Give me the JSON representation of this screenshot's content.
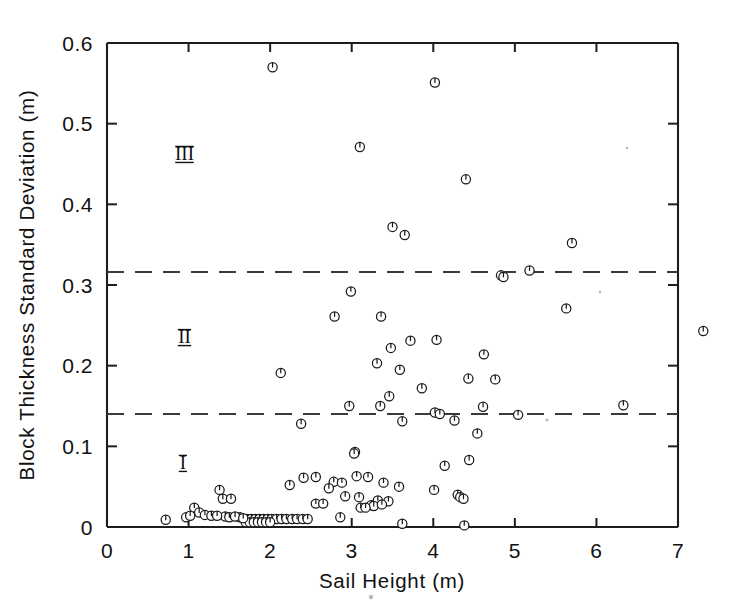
{
  "figure": {
    "background_color": "#ffffff",
    "ink_color": "#1a1a1a",
    "dash_color": "#3a3a3a"
  },
  "chart_data": {
    "type": "scatter",
    "title": "",
    "xlabel": "Sail Height (m)",
    "ylabel": "Block Thickness Standard Deviation (m)",
    "xlim": [
      0,
      7
    ],
    "ylim": [
      0,
      0.6
    ],
    "xticks": [
      0,
      1,
      2,
      3,
      4,
      5,
      6,
      7
    ],
    "xticklabels": [
      "0",
      "1",
      "2",
      "3",
      "4",
      "5",
      "6",
      "7"
    ],
    "yticks": [
      0,
      0.1,
      0.2,
      0.3,
      0.4,
      0.5,
      0.6
    ],
    "yticklabels": [
      "0",
      "0.1",
      "0.2",
      "0.3",
      "0.4",
      "0.5",
      "0.6"
    ],
    "grid": false,
    "legend": "none",
    "marker_style": "circle-with-vertical-tick",
    "annotations": [
      {
        "text": "III",
        "x": 0.95,
        "y": 0.455,
        "note": "zone-iii-label"
      },
      {
        "text": "II",
        "x": 0.95,
        "y": 0.228,
        "note": "zone-ii-label"
      },
      {
        "text": "I",
        "x": 0.93,
        "y": 0.072,
        "note": "zone-i-label"
      }
    ],
    "reference_lines": [
      {
        "orientation": "horizontal",
        "y": 0.316,
        "style": "dashed",
        "name": "zone-ii-iii-boundary"
      },
      {
        "orientation": "horizontal",
        "y": 0.14,
        "style": "dashed",
        "name": "zone-i-ii-boundary"
      }
    ],
    "points": [
      [
        2.03,
        0.57
      ],
      [
        4.02,
        0.551
      ],
      [
        3.1,
        0.471
      ],
      [
        4.4,
        0.431
      ],
      [
        5.7,
        0.352
      ],
      [
        3.5,
        0.372
      ],
      [
        3.65,
        0.362
      ],
      [
        2.99,
        0.292
      ],
      [
        4.83,
        0.312
      ],
      [
        4.86,
        0.31
      ],
      [
        5.18,
        0.318
      ],
      [
        2.79,
        0.261
      ],
      [
        3.36,
        0.261
      ],
      [
        5.63,
        0.271
      ],
      [
        7.31,
        0.243
      ],
      [
        3.48,
        0.222
      ],
      [
        4.62,
        0.214
      ],
      [
        4.04,
        0.232
      ],
      [
        3.72,
        0.231
      ],
      [
        3.31,
        0.203
      ],
      [
        3.59,
        0.195
      ],
      [
        2.13,
        0.191
      ],
      [
        4.76,
        0.183
      ],
      [
        4.43,
        0.184
      ],
      [
        3.86,
        0.172
      ],
      [
        3.46,
        0.162
      ],
      [
        2.97,
        0.15
      ],
      [
        3.35,
        0.15
      ],
      [
        4.02,
        0.142
      ],
      [
        4.61,
        0.149
      ],
      [
        4.08,
        0.14
      ],
      [
        5.04,
        0.139
      ],
      [
        6.33,
        0.151
      ],
      [
        2.38,
        0.128
      ],
      [
        3.62,
        0.131
      ],
      [
        4.26,
        0.132
      ],
      [
        4.54,
        0.116
      ],
      [
        3.04,
        0.093
      ],
      [
        3.03,
        0.091
      ],
      [
        4.44,
        0.083
      ],
      [
        4.14,
        0.076
      ],
      [
        2.41,
        0.061
      ],
      [
        2.56,
        0.062
      ],
      [
        3.06,
        0.063
      ],
      [
        3.2,
        0.062
      ],
      [
        2.78,
        0.056
      ],
      [
        2.88,
        0.055
      ],
      [
        3.39,
        0.055
      ],
      [
        2.24,
        0.052
      ],
      [
        3.58,
        0.05
      ],
      [
        2.72,
        0.048
      ],
      [
        4.01,
        0.046
      ],
      [
        1.38,
        0.046
      ],
      [
        1.42,
        0.035
      ],
      [
        1.52,
        0.035
      ],
      [
        2.92,
        0.038
      ],
      [
        3.09,
        0.037
      ],
      [
        3.32,
        0.033
      ],
      [
        3.45,
        0.032
      ],
      [
        4.3,
        0.04
      ],
      [
        4.33,
        0.037
      ],
      [
        4.37,
        0.035
      ],
      [
        2.56,
        0.029
      ],
      [
        2.65,
        0.029
      ],
      [
        3.24,
        0.027
      ],
      [
        3.27,
        0.026
      ],
      [
        3.37,
        0.028
      ],
      [
        3.11,
        0.024
      ],
      [
        3.17,
        0.024
      ],
      [
        1.07,
        0.024
      ],
      [
        1.13,
        0.018
      ],
      [
        1.2,
        0.015
      ],
      [
        1.28,
        0.014
      ],
      [
        1.45,
        0.013
      ],
      [
        1.5,
        0.012
      ],
      [
        1.63,
        0.012
      ],
      [
        1.72,
        0.01
      ],
      [
        1.77,
        0.01
      ],
      [
        1.82,
        0.01
      ],
      [
        1.87,
        0.01
      ],
      [
        1.92,
        0.01
      ],
      [
        1.97,
        0.01
      ],
      [
        2.02,
        0.01
      ],
      [
        2.08,
        0.01
      ],
      [
        2.14,
        0.01
      ],
      [
        2.2,
        0.01
      ],
      [
        2.27,
        0.01
      ],
      [
        2.33,
        0.01
      ],
      [
        2.4,
        0.01
      ],
      [
        2.46,
        0.01
      ],
      [
        1.7,
        0.006
      ],
      [
        1.75,
        0.006
      ],
      [
        1.8,
        0.006
      ],
      [
        1.85,
        0.006
      ],
      [
        1.9,
        0.006
      ],
      [
        1.95,
        0.006
      ],
      [
        2.0,
        0.006
      ],
      [
        0.72,
        0.009
      ],
      [
        0.97,
        0.012
      ],
      [
        1.02,
        0.014
      ],
      [
        2.86,
        0.012
      ],
      [
        3.62,
        0.004
      ],
      [
        4.38,
        0.002
      ],
      [
        1.35,
        0.014
      ],
      [
        1.57,
        0.013
      ],
      [
        1.67,
        0.011
      ]
    ]
  }
}
